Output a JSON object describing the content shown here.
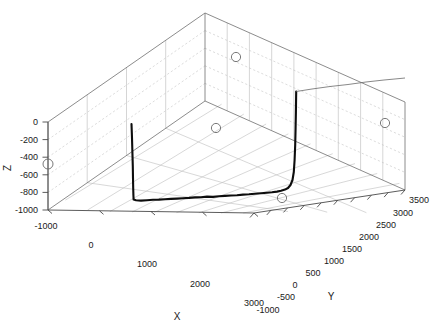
{
  "figure": {
    "type": "matlab-3d-plot",
    "background_color": "#ffffff",
    "width": 440,
    "height": 331
  },
  "axes": {
    "x": {
      "label": "X",
      "ticks": [
        "-1000",
        "0",
        "1000",
        "2000",
        "3000"
      ],
      "values": [
        -1000,
        0,
        1000,
        2000,
        3000
      ],
      "min": -1000,
      "max": 3000
    },
    "y": {
      "label": "Y",
      "ticks": [
        "-1000",
        "-500",
        "0",
        "500",
        "1000",
        "1500",
        "2000",
        "2500",
        "3000",
        "3500"
      ],
      "values": [
        -1000,
        -500,
        0,
        500,
        1000,
        1500,
        2000,
        2500,
        3000,
        3500
      ],
      "min": -1000,
      "max": 3500
    },
    "z": {
      "label": "Z",
      "ticks": [
        "0",
        "-200",
        "-400",
        "-600",
        "-800",
        "-1000"
      ],
      "values": [
        0,
        -200,
        -400,
        -600,
        -800,
        -1000
      ],
      "min": -1000,
      "max": 0
    }
  },
  "chart_data": {
    "type": "line",
    "title": "",
    "xlabel": "X",
    "ylabel": "Y",
    "zlabel": "Z",
    "xlim": [
      -1000,
      3000
    ],
    "ylim": [
      -1000,
      3500
    ],
    "zlim": [
      -1000,
      0
    ],
    "grid": true,
    "legend": null,
    "projection": "3d-orthographic",
    "xticks": [
      -1000,
      0,
      1000,
      2000,
      3000
    ],
    "yticks": [
      -1000,
      -500,
      0,
      500,
      1000,
      1500,
      2000,
      2500,
      3000,
      3500
    ],
    "zticks": [
      0,
      -200,
      -400,
      -600,
      -800,
      -1000
    ],
    "series": [
      {
        "name": "trajectory",
        "style": "solid-thick-black",
        "color": "#0d0d0d",
        "screen_points": [
          [
            131.5,
            124.0
          ],
          [
            132.0,
            138.0
          ],
          [
            132.4,
            152.0
          ],
          [
            132.8,
            166.0
          ],
          [
            133.0,
            178.0
          ],
          [
            133.2,
            188.0
          ],
          [
            133.4,
            195.0
          ],
          [
            133.6,
            199.6
          ],
          [
            136.0,
            200.3
          ],
          [
            141.0,
            200.6
          ],
          [
            147.0,
            200.2
          ],
          [
            153.0,
            199.8
          ],
          [
            159.0,
            199.6
          ],
          [
            165.0,
            199.2
          ],
          [
            171.0,
            198.9
          ],
          [
            177.0,
            198.6
          ],
          [
            183.0,
            198.2
          ],
          [
            189.0,
            197.9
          ],
          [
            195.0,
            197.4
          ],
          [
            201.0,
            197.2
          ],
          [
            207.0,
            196.6
          ],
          [
            213.0,
            196.9
          ],
          [
            219.0,
            196.2
          ],
          [
            225.0,
            195.9
          ],
          [
            231.0,
            195.5
          ],
          [
            237.0,
            195.2
          ],
          [
            243.0,
            194.6
          ],
          [
            249.0,
            194.3
          ],
          [
            255.0,
            193.8
          ],
          [
            261.0,
            193.3
          ],
          [
            267.0,
            192.8
          ],
          [
            272.0,
            192.3
          ],
          [
            277.0,
            191.6
          ],
          [
            281.0,
            190.8
          ],
          [
            285.0,
            189.6
          ],
          [
            288.0,
            188.0
          ],
          [
            290.5,
            185.0
          ],
          [
            292.5,
            180.0
          ],
          [
            293.8,
            172.0
          ],
          [
            294.6,
            160.0
          ],
          [
            295.2,
            145.0
          ],
          [
            295.6,
            128.0
          ],
          [
            295.9,
            112.0
          ],
          [
            296.1,
            98.0
          ],
          [
            296.2,
            91.5
          ]
        ]
      },
      {
        "name": "trajectory-tail",
        "style": "solid-thin-gray",
        "color": "#6a6a6a",
        "screen_points": [
          [
            296.2,
            91.5
          ],
          [
            312.0,
            89.0
          ],
          [
            330.0,
            86.5
          ],
          [
            348.0,
            84.5
          ],
          [
            366.0,
            82.0
          ],
          [
            384.0,
            80.0
          ],
          [
            400.0,
            78.5
          ],
          [
            405.0,
            78.0
          ]
        ]
      }
    ],
    "markers": [
      {
        "name": "marker-1",
        "screen_x": 48,
        "screen_y": 164,
        "radius": 5.0
      },
      {
        "name": "marker-2",
        "screen_x": 216,
        "screen_y": 128,
        "radius": 4.6
      },
      {
        "name": "marker-3",
        "screen_x": 236,
        "screen_y": 57,
        "radius": 4.6
      },
      {
        "name": "marker-4",
        "screen_x": 385,
        "screen_y": 123,
        "radius": 4.6
      },
      {
        "name": "marker-5",
        "screen_x": 282,
        "screen_y": 198,
        "radius": 4.6
      }
    ]
  },
  "geometry": {
    "box": {
      "top_apex": [
        205,
        13
      ],
      "left_top": [
        48,
        122
      ],
      "right_top": [
        405,
        102
      ],
      "front_bottom": [
        254,
        213
      ],
      "left_bottom": [
        48,
        210
      ],
      "right_bottom": [
        405,
        190
      ],
      "back_bottom": [
        205,
        101
      ]
    }
  }
}
